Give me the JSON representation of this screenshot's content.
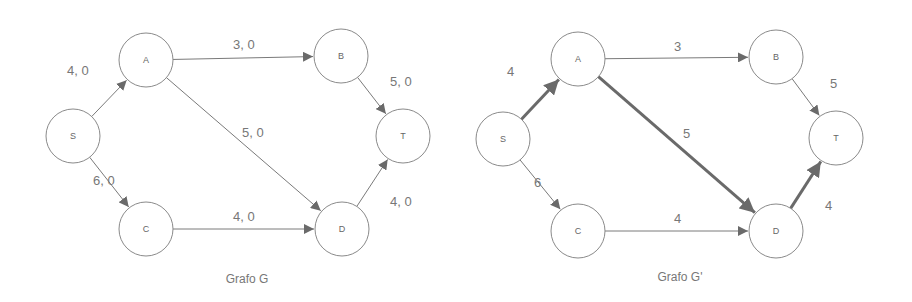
{
  "graphs": [
    {
      "caption": "Grafo G",
      "caption_pos": [
        247,
        279
      ],
      "nodes": [
        {
          "id": "S",
          "x": 73,
          "y": 136
        },
        {
          "id": "A",
          "x": 146,
          "y": 60
        },
        {
          "id": "B",
          "x": 341,
          "y": 56
        },
        {
          "id": "T",
          "x": 403,
          "y": 136
        },
        {
          "id": "C",
          "x": 146,
          "y": 229
        },
        {
          "id": "D",
          "x": 342,
          "y": 229
        }
      ],
      "edges": [
        {
          "from": "S",
          "to": "A",
          "label": "4, 0",
          "lx": 67,
          "ly": 70,
          "bold": false
        },
        {
          "from": "A",
          "to": "B",
          "label": "3, 0",
          "lx": 233,
          "ly": 44,
          "bold": false
        },
        {
          "from": "A",
          "to": "D",
          "label": "5, 0",
          "lx": 242,
          "ly": 132,
          "bold": false
        },
        {
          "from": "B",
          "to": "T",
          "label": "5, 0",
          "lx": 390,
          "ly": 81,
          "bold": false
        },
        {
          "from": "S",
          "to": "C",
          "label": "6, 0",
          "lx": 93,
          "ly": 180,
          "bold": false
        },
        {
          "from": "C",
          "to": "D",
          "label": "4, 0",
          "lx": 233,
          "ly": 216,
          "bold": false
        },
        {
          "from": "D",
          "to": "T",
          "label": "4, 0",
          "lx": 390,
          "ly": 201,
          "bold": false
        }
      ]
    },
    {
      "caption": "Grafo G'",
      "caption_pos": [
        680,
        277
      ],
      "nodes": [
        {
          "id": "S",
          "x": 503,
          "y": 139
        },
        {
          "id": "A",
          "x": 578,
          "y": 59
        },
        {
          "id": "B",
          "x": 776,
          "y": 57
        },
        {
          "id": "T",
          "x": 836,
          "y": 138
        },
        {
          "id": "C",
          "x": 578,
          "y": 231
        },
        {
          "id": "D",
          "x": 776,
          "y": 231
        }
      ],
      "edges": [
        {
          "from": "S",
          "to": "A",
          "label": "4",
          "lx": 507,
          "ly": 71,
          "bold": true
        },
        {
          "from": "A",
          "to": "B",
          "label": "3",
          "lx": 674,
          "ly": 46,
          "bold": false
        },
        {
          "from": "A",
          "to": "D",
          "label": "5",
          "lx": 683,
          "ly": 133,
          "bold": true
        },
        {
          "from": "B",
          "to": "T",
          "label": "5",
          "lx": 830,
          "ly": 83,
          "bold": false
        },
        {
          "from": "S",
          "to": "C",
          "label": "6",
          "lx": 534,
          "ly": 182,
          "bold": false
        },
        {
          "from": "C",
          "to": "D",
          "label": "4",
          "lx": 674,
          "ly": 218,
          "bold": false
        },
        {
          "from": "D",
          "to": "T",
          "label": "4",
          "lx": 825,
          "ly": 205,
          "bold": true
        }
      ]
    }
  ],
  "node_radius": 27
}
